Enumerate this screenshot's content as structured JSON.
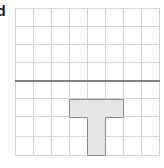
{
  "figure": {
    "label": "d",
    "grid": {
      "cols": 8,
      "rows": 8,
      "origin_x": 15,
      "origin_y": 8,
      "cell": 18,
      "line_color": "#d4d4d4"
    },
    "divider": {
      "row_boundary": 4,
      "color": "#555555"
    },
    "shape": {
      "name": "T-tetromino",
      "fill": "#e6e6e6",
      "stroke": "#8a8a8a",
      "cells": [
        [
          5,
          3
        ],
        [
          5,
          4
        ],
        [
          5,
          5
        ],
        [
          6,
          4
        ],
        [
          7,
          4
        ]
      ]
    }
  }
}
